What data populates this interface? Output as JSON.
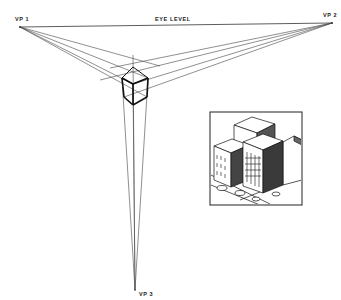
{
  "diagram": {
    "labels": {
      "vp1": "VP 1",
      "vp2": "VP 2",
      "vp3": "VP 3",
      "horizon": "EYE LEVEL"
    },
    "points": {
      "vp1": [
        20,
        27
      ],
      "vp2": [
        332,
        23
      ],
      "vp3": [
        135,
        290
      ]
    },
    "cube": {
      "top_back": [
        133,
        67
      ],
      "top_left": [
        122,
        78
      ],
      "top_right": [
        148,
        78
      ],
      "top_front": [
        133,
        84
      ],
      "bottom_left": [
        124,
        97
      ],
      "bottom_right": [
        147,
        97
      ],
      "bottom_front": [
        133,
        105
      ]
    },
    "inset": {
      "name": "city-buildings-illustration",
      "frame": [
        210,
        112,
        92,
        93
      ]
    },
    "colors": {
      "line": "#333333",
      "cube_edge": "#111111",
      "background": "#ffffff"
    }
  }
}
